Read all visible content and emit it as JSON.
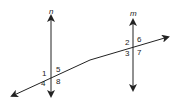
{
  "diagram": {
    "lines": {
      "n": "n",
      "m": "m"
    },
    "angles": {
      "a1": "1",
      "a2": "2",
      "a3": "3",
      "a4": "4",
      "a5": "5",
      "a6": "6",
      "a7": "7",
      "a8": "8"
    },
    "colors": {
      "stroke": "#222222"
    }
  }
}
